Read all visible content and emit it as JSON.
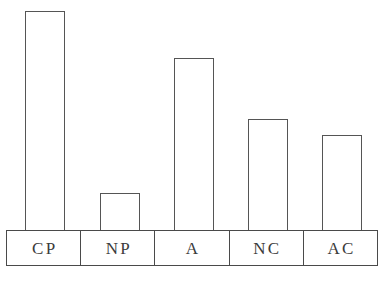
{
  "chart_data": {
    "type": "bar",
    "title": "",
    "subtitle": "",
    "xlabel": "",
    "ylabel": "",
    "categories": [
      "CP",
      "NP",
      "A",
      "NC",
      "AC"
    ],
    "values": [
      100,
      17,
      79,
      51,
      43
    ],
    "ylim": [
      0,
      100
    ],
    "grid": false,
    "legend": null,
    "annotations": [],
    "style": {
      "bar_fill": "#ffffff",
      "bar_stroke": "#555555",
      "label_box_stroke": "#4a4a4a",
      "label_text_color": "#3b3b3b",
      "background": "#ffffff"
    },
    "bars": [
      {
        "category": "CP",
        "value": 100,
        "top_px": 11,
        "left_px": 25,
        "width_px": 40,
        "height_px": 219
      },
      {
        "category": "NP",
        "value": 17,
        "top_px": 193,
        "left_px": 100,
        "width_px": 40,
        "height_px": 37
      },
      {
        "category": "A",
        "value": 79,
        "top_px": 58,
        "left_px": 174,
        "width_px": 40,
        "height_px": 172
      },
      {
        "category": "NC",
        "value": 51,
        "top_px": 119,
        "left_px": 248,
        "width_px": 40,
        "height_px": 111
      },
      {
        "category": "AC",
        "value": 43,
        "top_px": 135,
        "left_px": 322,
        "width_px": 40,
        "height_px": 95
      }
    ]
  },
  "labels": {
    "cp": "CP",
    "np": "NP",
    "a": "A",
    "nc": "NC",
    "ac": "AC"
  }
}
